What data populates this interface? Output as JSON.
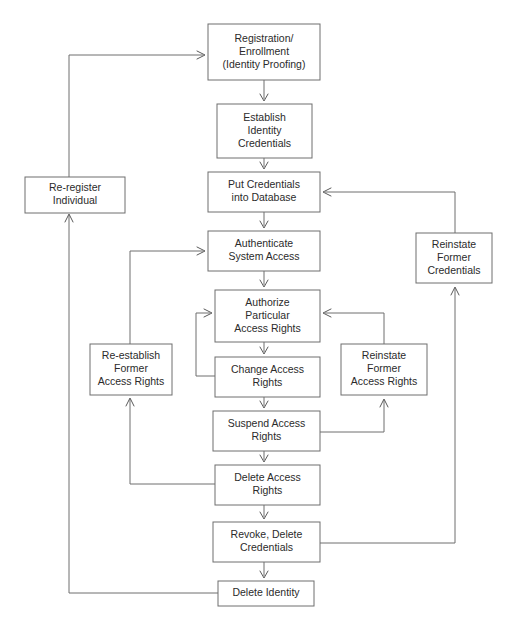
{
  "diagram": {
    "background_color": "#ffffff",
    "box_stroke_color": "#6e6e6e",
    "box_fill_color": "#ffffff",
    "text_color": "#2b2b2b",
    "connector_color": "#6e6e6e",
    "nodes": [
      {
        "id": "registration",
        "lines": [
          "Registration/",
          "Enrollment",
          "(Identity Proofing)"
        ],
        "x": 208,
        "y": 24,
        "w": 112,
        "h": 56
      },
      {
        "id": "establish-identity-credentials",
        "lines": [
          "Establish",
          "Identity",
          "Credentials"
        ],
        "x": 217,
        "y": 104,
        "w": 95,
        "h": 54
      },
      {
        "id": "put-credentials-into-database",
        "lines": [
          "Put Credentials",
          "into Database"
        ],
        "x": 208,
        "y": 172,
        "w": 112,
        "h": 40
      },
      {
        "id": "authenticate-system-access",
        "lines": [
          "Authenticate",
          "System Access"
        ],
        "x": 208,
        "y": 231,
        "w": 112,
        "h": 40
      },
      {
        "id": "authorize-particular-access-rights",
        "lines": [
          "Authorize",
          "Particular",
          "Access Rights"
        ],
        "x": 215,
        "y": 290,
        "w": 105,
        "h": 52
      },
      {
        "id": "change-access-rights",
        "lines": [
          "Change Access",
          "Rights"
        ],
        "x": 215,
        "y": 357,
        "w": 105,
        "h": 40
      },
      {
        "id": "suspend-access-rights",
        "lines": [
          "Suspend Access",
          "Rights"
        ],
        "x": 213,
        "y": 411,
        "w": 107,
        "h": 40
      },
      {
        "id": "delete-access-rights",
        "lines": [
          "Delete Access",
          "Rights"
        ],
        "x": 215,
        "y": 465,
        "w": 105,
        "h": 40
      },
      {
        "id": "revoke-delete-credentials",
        "lines": [
          "Revoke, Delete",
          "Credentials"
        ],
        "x": 213,
        "y": 522,
        "w": 107,
        "h": 40
      },
      {
        "id": "delete-identity",
        "lines": [
          "Delete Identity"
        ],
        "x": 218,
        "y": 581,
        "w": 96,
        "h": 25
      },
      {
        "id": "re-register-individual",
        "lines": [
          "Re-register",
          "Individual"
        ],
        "x": 25,
        "y": 177,
        "w": 100,
        "h": 36
      },
      {
        "id": "re-establish-former-access-rights",
        "lines": [
          "Re-establish",
          "Former",
          "Access Rights"
        ],
        "x": 90,
        "y": 344,
        "w": 82,
        "h": 51
      },
      {
        "id": "reinstate-former-access-rights",
        "lines": [
          "Reinstate",
          "Former",
          "Access Rights"
        ],
        "x": 341,
        "y": 344,
        "w": 86,
        "h": 51
      },
      {
        "id": "reinstate-former-credentials",
        "lines": [
          "Reinstate",
          "Former",
          "Credentials"
        ],
        "x": 416,
        "y": 233,
        "w": 76,
        "h": 50
      }
    ],
    "edges": [
      {
        "id": "registration-to-establish",
        "from": "registration",
        "to": "establish-identity-credentials",
        "path": "M264,80 L264,99",
        "arrow": "M260,94 L264,101 L268,94"
      },
      {
        "id": "establish-to-put-credentials",
        "from": "establish-identity-credentials",
        "to": "put-credentials-into-database",
        "path": "M264,158 L264,167",
        "arrow": "M260,162 L264,169 L268,162"
      },
      {
        "id": "put-credentials-to-authenticate",
        "from": "put-credentials-into-database",
        "to": "authenticate-system-access",
        "path": "M264,212 L264,226",
        "arrow": "M260,221 L264,228 L268,221"
      },
      {
        "id": "authenticate-to-authorize",
        "from": "authenticate-system-access",
        "to": "authorize-particular-access-rights",
        "path": "M264,271 L264,285",
        "arrow": "M260,280 L264,287 L268,280"
      },
      {
        "id": "authorize-to-change",
        "from": "authorize-particular-access-rights",
        "to": "change-access-rights",
        "path": "M264,342 L264,352",
        "arrow": "M260,347 L264,354 L268,347"
      },
      {
        "id": "change-to-suspend",
        "from": "change-access-rights",
        "to": "suspend-access-rights",
        "path": "M264,397 L264,406",
        "arrow": "M260,401 L264,408 L268,401"
      },
      {
        "id": "suspend-to-delete-access",
        "from": "suspend-access-rights",
        "to": "delete-access-rights",
        "path": "M264,451 L264,460",
        "arrow": "M260,455 L264,462 L268,455"
      },
      {
        "id": "delete-access-to-revoke",
        "from": "delete-access-rights",
        "to": "revoke-delete-credentials",
        "path": "M264,505 L264,517",
        "arrow": "M260,512 L264,519 L268,512"
      },
      {
        "id": "revoke-to-delete-identity",
        "from": "revoke-delete-credentials",
        "to": "delete-identity",
        "path": "M264,562 L264,576",
        "arrow": "M260,571 L264,578 L268,571"
      },
      {
        "id": "delete-identity-to-re-register",
        "from": "delete-identity",
        "to": "re-register-individual",
        "path": "M218,593 L69,593 L69,215",
        "arrow": "M65,222 L69,214 L73,222"
      },
      {
        "id": "re-register-to-registration",
        "from": "re-register-individual",
        "to": "registration",
        "path": "M69,177 L69,55 L203,55",
        "arrow": "M197,51 L205,55 L197,59"
      },
      {
        "id": "delete-access-to-re-establish",
        "from": "delete-access-rights",
        "to": "re-establish-former-access-rights",
        "path": "M215,484 L130,484 L130,399",
        "arrow": "M126,406 L130,398 L134,406"
      },
      {
        "id": "re-establish-to-authenticate",
        "from": "re-establish-former-access-rights",
        "to": "authenticate-system-access",
        "path": "M130,344 L130,251 L203,251",
        "arrow": "M197,247 L205,251 L197,255"
      },
      {
        "id": "change-to-authorize-loop",
        "from": "change-access-rights",
        "to": "authorize-particular-access-rights",
        "path": "M215,376 L196,376 L196,313 L210,313",
        "arrow": "M204,309 L212,313 L204,317"
      },
      {
        "id": "suspend-to-reinstate-access-rights",
        "from": "suspend-access-rights",
        "to": "reinstate-former-access-rights",
        "path": "M320,432 L384,432 L384,400",
        "arrow": "M380,407 L384,399 L388,407"
      },
      {
        "id": "reinstate-access-rights-to-authorize",
        "from": "reinstate-former-access-rights",
        "to": "authorize-particular-access-rights",
        "path": "M384,344 L384,313 L325,313",
        "arrow": "M331,309 L323,313 L331,317"
      },
      {
        "id": "revoke-to-reinstate-credentials",
        "from": "revoke-delete-credentials",
        "to": "reinstate-former-credentials",
        "path": "M320,543 L455,543 L455,288",
        "arrow": "M451,295 L455,287 L459,295"
      },
      {
        "id": "reinstate-credentials-to-put-credentials",
        "from": "reinstate-former-credentials",
        "to": "put-credentials-into-database",
        "path": "M455,233 L455,192 L325,192",
        "arrow": "M331,188 L323,192 L331,196"
      }
    ]
  }
}
